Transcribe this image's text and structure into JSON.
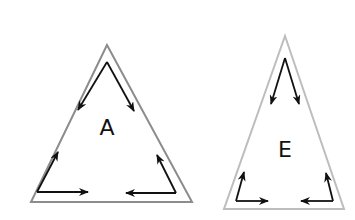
{
  "diagram": {
    "triangles": [
      {
        "label": "A",
        "type": "equilateral",
        "outline_color": "#8c8c8c"
      },
      {
        "label": "E",
        "type": "isosceles",
        "outline_color": "#bdbdbd"
      }
    ],
    "arrow_color": "#111111"
  }
}
